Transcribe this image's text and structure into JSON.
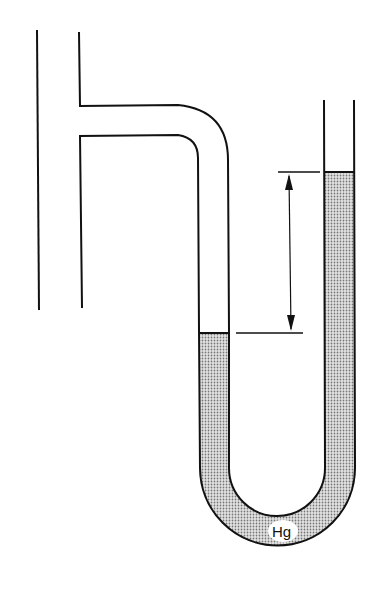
{
  "diagram": {
    "type": "U-tube manometer connected to pipe",
    "labels": {
      "fluid": "Hg"
    },
    "colors": {
      "line": "#111111",
      "mercury_fill": "#c8c8c8",
      "background": "#ffffff"
    }
  }
}
